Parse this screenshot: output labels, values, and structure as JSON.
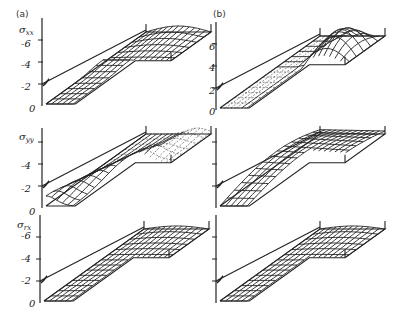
{
  "figure": {
    "columns": [
      {
        "id": "a",
        "label": "(a)"
      },
      {
        "id": "b",
        "label": "(b)"
      }
    ],
    "rows": [
      {
        "id": "sxx",
        "symbol": "σ",
        "subscript": "xx",
        "ticks": [
          "-6",
          "-4",
          "-2",
          "0"
        ],
        "ticks_b": [
          "6",
          "4",
          "2",
          "0"
        ]
      },
      {
        "id": "syy",
        "symbol": "σ",
        "subscript": "yy",
        "ticks": [
          "-4",
          "-2",
          "0"
        ],
        "ticks_b": []
      },
      {
        "id": "srx",
        "symbol": "σ",
        "subscript": "rx",
        "ticks": [
          "-6",
          "-4",
          "-2",
          "0"
        ],
        "ticks_b": []
      }
    ]
  },
  "chart_data": [
    {
      "type": "surface",
      "panel": "a",
      "row": "sxx",
      "ylabel": "σxx",
      "tick_labels": [
        "-6",
        "-4",
        "-2",
        "0"
      ],
      "zlim": [
        0,
        -7
      ],
      "shape": "L-shaped plate",
      "feature": "shallow trough near far edge, bump at inner corner"
    },
    {
      "type": "surface",
      "panel": "b",
      "row": "sxx",
      "ylabel": "σxx",
      "tick_labels": [
        "6",
        "4",
        "2",
        "0"
      ],
      "zlim": [
        0,
        7
      ],
      "shape": "L-shaped plate",
      "feature": "large raised dome on upper arm"
    },
    {
      "type": "surface",
      "panel": "a",
      "row": "syy",
      "ylabel": "σyy",
      "tick_labels": [
        "-4",
        "-2",
        "0"
      ],
      "zlim": [
        0,
        -5
      ],
      "shape": "L-shaped plate",
      "feature": "ridge along the diagonal of the long arm"
    },
    {
      "type": "surface",
      "panel": "b",
      "row": "syy",
      "ylabel": "σyy",
      "tick_labels": [],
      "zlim": [
        0,
        5
      ],
      "shape": "L-shaped plate",
      "feature": "wave-shaped surface rising toward back"
    },
    {
      "type": "surface",
      "panel": "a",
      "row": "srx",
      "ylabel": "σrx",
      "tick_labels": [
        "-6",
        "-4",
        "-2",
        "0"
      ],
      "zlim": [
        0,
        -7
      ],
      "shape": "L-shaped plate",
      "feature": "mostly flat with slight dip at corner"
    },
    {
      "type": "surface",
      "panel": "b",
      "row": "srx",
      "ylabel": "σrx",
      "tick_labels": [],
      "zlim": [
        0,
        7
      ],
      "shape": "L-shaped plate",
      "feature": "mostly flat with slight dip at corner"
    }
  ]
}
